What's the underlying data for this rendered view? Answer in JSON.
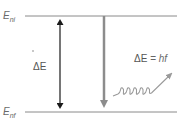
{
  "diagram": {
    "type": "energy-level-transition",
    "levels": {
      "initial": {
        "symbol": "E",
        "subscript": "ni",
        "y": 16
      },
      "final": {
        "symbol": "E",
        "subscript": "nf",
        "y": 112
      }
    },
    "energy_gap_label": "ΔE",
    "photon_label": {
      "lhs": "ΔE",
      "eq": " = ",
      "rhs": "hf"
    },
    "colors": {
      "level_line": "#8a8a8a",
      "gap_arrow": "#1a1a1a",
      "transition_arrow": "#8c8c8c",
      "photon_wave": "#9a9a9a",
      "text": "#666666"
    }
  }
}
